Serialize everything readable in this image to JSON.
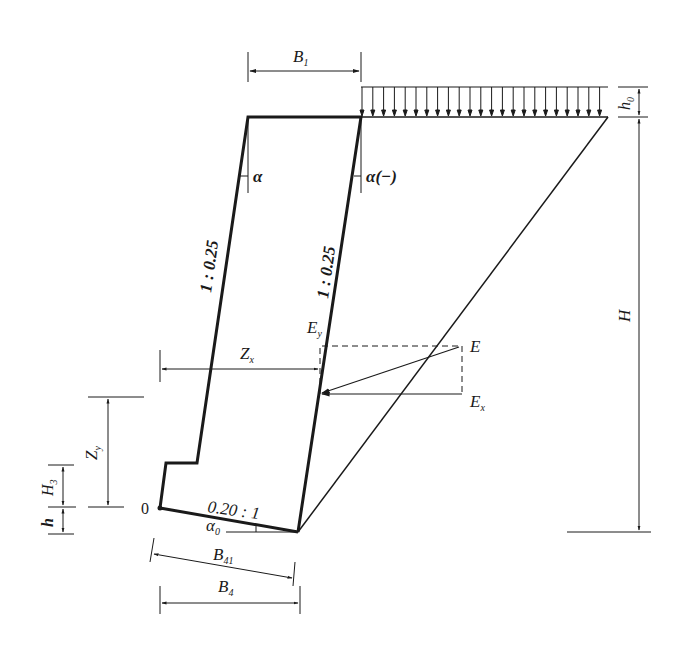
{
  "diagram": {
    "labels": {
      "B1": "B",
      "B1_sub": "1",
      "h0": "h",
      "h0_sub": "0",
      "H": "H",
      "alpha": "α",
      "alpha_neg": "α(−)",
      "slope_front": "1 : 0.25",
      "slope_back": "1 : 0.25",
      "Ey": "E",
      "Ey_sub": "y",
      "E": "E",
      "Ex": "E",
      "Ex_sub": "x",
      "Zx": "Z",
      "Zx_sub": "x",
      "Zy": "Z",
      "Zy_sub": "y",
      "H3": "H",
      "H3_sub": "3",
      "h": "h",
      "origin": "0",
      "base_slope": "0.20 : 1",
      "alpha0": "α",
      "alpha0_sub": "0",
      "B41": "B",
      "B41_sub": "41",
      "B4": "B",
      "B4_sub": "4"
    },
    "colors": {
      "line": "#1a1a1a",
      "background": "#ffffff"
    }
  }
}
